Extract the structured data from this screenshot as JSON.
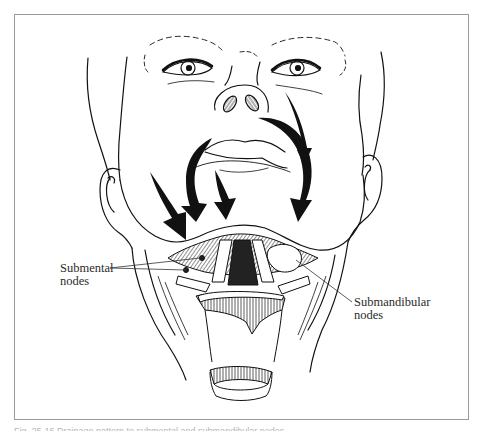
{
  "figure": {
    "labels": {
      "submental": "Submental\nnodes",
      "submandibular": "Submandibular\nnodes"
    },
    "caption_partial": "Fig. 25-16  Drainage pattern to submental and submandibular nodes"
  },
  "colors": {
    "ink": "#111111",
    "frame": "#9a9a9a",
    "label_text": "#2a2a2a",
    "background": "#ffffff"
  }
}
